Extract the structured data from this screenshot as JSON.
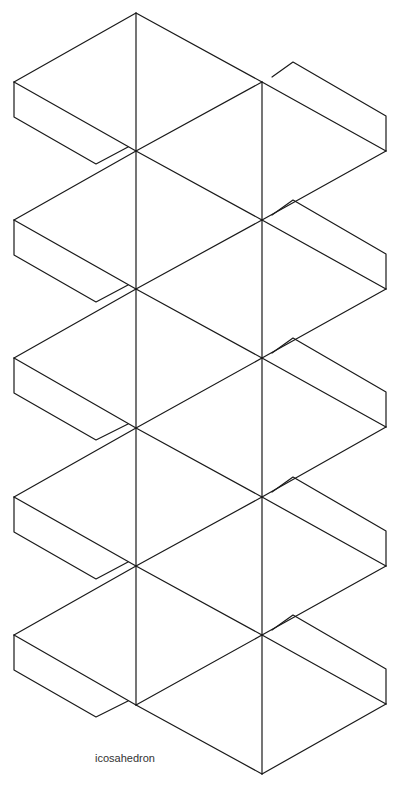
{
  "diagram": {
    "title": "icosahedron",
    "kind": "paper net with glue tabs",
    "faces": 20,
    "glue_tabs_left": 5,
    "glue_tabs_right": 5,
    "line_color": "#1a1a1a",
    "background": "#ffffff"
  },
  "geometry": {
    "left_column_x": 136,
    "right_column_x": 262,
    "left_vertices_y": [
      13,
      151,
      289,
      428,
      566,
      705
    ],
    "right_vertices_y": [
      82,
      220,
      358,
      497,
      635,
      774
    ],
    "left_outer_x": 14,
    "right_outer_x": 386
  }
}
